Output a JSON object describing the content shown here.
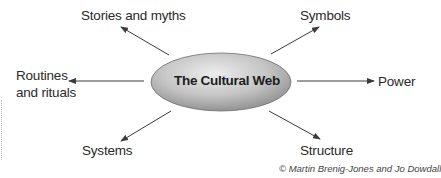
{
  "diagram": {
    "title": "The Cultural Web",
    "nodes": [
      {
        "id": "stories",
        "label": "Stories and myths"
      },
      {
        "id": "symbols",
        "label": "Symbols"
      },
      {
        "id": "routines",
        "label_line1": "Routines",
        "label_line2": "and rituals"
      },
      {
        "id": "power",
        "label": "Power"
      },
      {
        "id": "systems",
        "label": "Systems"
      },
      {
        "id": "structure",
        "label": "Structure"
      }
    ],
    "credit": "© Martin Brenig-Jones and Jo Dowdall",
    "colors": {
      "ellipse_light": "#e6e6e6",
      "ellipse_dark": "#8c8c8c",
      "arrow": "#3a3a3a"
    }
  }
}
